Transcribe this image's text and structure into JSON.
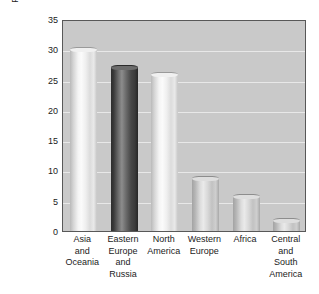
{
  "chart_data": {
    "type": "bar",
    "title": "",
    "subtitle": "",
    "xlabel": "",
    "ylabel": "Percent of proved recoverable\ncoal reserves, 2000",
    "ylim": [
      0,
      35
    ],
    "ytick_step": 5,
    "ytick_labels": [
      "35",
      "30",
      "25",
      "20",
      "15",
      "10",
      "5",
      "0"
    ],
    "ytick_values": [
      35,
      30,
      25,
      20,
      15,
      10,
      5,
      0
    ],
    "grid": true,
    "legend": "none",
    "categories": [
      "Asia\nand\nOceania",
      "Eastern\nEurope\nand\nRussia",
      "North\nAmerica",
      "Western\nEurope",
      "Africa",
      "Central\nand\nSouth\nAmerica"
    ],
    "values": [
      30.0,
      27.0,
      25.9,
      8.7,
      5.7,
      1.8
    ],
    "bar_tones": [
      "light",
      "dark",
      "light",
      "mid",
      "mid",
      "mid"
    ],
    "colors": {
      "plot_background": "#c9c9c9",
      "gridline": "#e8e8e8",
      "axis_border": "#585858",
      "page_background": "#ffffff",
      "text": "#1b1b1b",
      "bar_light": "#f4f4f4",
      "bar_dark": "#3a3a3a",
      "bar_mid": "#d8d8d8"
    }
  }
}
